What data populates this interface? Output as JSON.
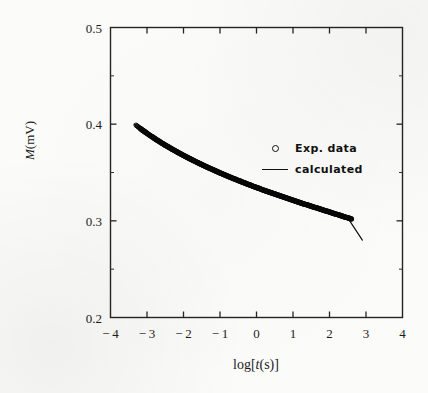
{
  "figure": {
    "background_color": "#fbfbfa",
    "ink_color": "#1a1a1a"
  },
  "axes": {
    "x_label_prefix": "log[",
    "x_label_italic": "t",
    "x_label_suffix": "(s)]",
    "y_label_italic": "M",
    "y_label_rest": "(mV)",
    "x_ticks": [
      "-4",
      "-3",
      "-2",
      "-1",
      "0",
      "1",
      "2",
      "3",
      "4"
    ],
    "y_ticks": [
      "0.5",
      "0.4",
      "0.3",
      "0.2"
    ]
  },
  "legend": {
    "items": [
      {
        "key": "open-circle",
        "label": "Exp. data"
      },
      {
        "key": "solid-line",
        "label": "calculated"
      }
    ]
  },
  "chart_data": {
    "type": "scatter",
    "title": "",
    "xlabel": "log[t(s)]",
    "ylabel": "M(mV)",
    "xlim": [
      -4,
      4
    ],
    "ylim": [
      0.2,
      0.5
    ],
    "xticks": [
      -4,
      -3,
      -2,
      -1,
      0,
      1,
      2,
      3,
      4
    ],
    "yticks": [
      0.2,
      0.3,
      0.4,
      0.5
    ],
    "grid": false,
    "legend_position": "upper right (inside axes)",
    "series": [
      {
        "name": "Exp. data",
        "type": "scatter",
        "marker": "open-circle",
        "x": [
          -3.3,
          -3.2,
          -3.1,
          -3.0,
          -2.9,
          -2.8,
          -2.7,
          -2.6,
          -2.5,
          -2.4,
          -2.3,
          -2.2,
          -2.1,
          -2.0,
          -1.9,
          -1.8,
          -1.7,
          -1.6,
          -1.5,
          -1.4,
          -1.3,
          -1.2,
          -1.1,
          -1.0,
          -0.9,
          -0.8,
          -0.7,
          -0.6,
          -0.5,
          -0.4,
          -0.3,
          -0.2,
          -0.1,
          0.0,
          0.1,
          0.2,
          0.3,
          0.4,
          0.5,
          0.6,
          0.7,
          0.8,
          0.9,
          1.0,
          1.1,
          1.2,
          1.3,
          1.4,
          1.5,
          1.6,
          1.7,
          1.8,
          1.9,
          2.0,
          2.1,
          2.2,
          2.3,
          2.4,
          2.5,
          2.6
        ],
        "y": [
          0.399,
          0.396,
          0.3932,
          0.3905,
          0.3879,
          0.3854,
          0.383,
          0.3806,
          0.3783,
          0.3761,
          0.3739,
          0.3718,
          0.3697,
          0.3677,
          0.3657,
          0.3638,
          0.3619,
          0.36,
          0.3582,
          0.3564,
          0.3547,
          0.353,
          0.3513,
          0.3496,
          0.348,
          0.3464,
          0.3448,
          0.3433,
          0.3418,
          0.3403,
          0.3388,
          0.3373,
          0.3359,
          0.3345,
          0.3331,
          0.3317,
          0.3304,
          0.329,
          0.3277,
          0.3264,
          0.3251,
          0.3238,
          0.3225,
          0.3213,
          0.32,
          0.3188,
          0.3175,
          0.3163,
          0.3151,
          0.3139,
          0.3127,
          0.3115,
          0.3103,
          0.3091,
          0.3079,
          0.3067,
          0.3055,
          0.3043,
          0.3031,
          0.3019
        ]
      },
      {
        "name": "calculated",
        "type": "line",
        "x": [
          -3.35,
          -3.0,
          -2.5,
          -2.0,
          -1.5,
          -1.0,
          -0.5,
          0.0,
          0.5,
          1.0,
          1.5,
          2.0,
          2.5,
          2.9
        ],
        "y": [
          0.4,
          0.3905,
          0.3783,
          0.3677,
          0.3582,
          0.3496,
          0.3418,
          0.3345,
          0.3277,
          0.3213,
          0.3151,
          0.3091,
          0.3031,
          0.28
        ]
      }
    ]
  }
}
